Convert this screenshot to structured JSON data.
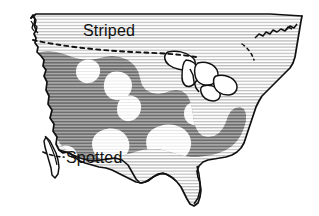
{
  "figure": {
    "type": "thematic-range-map",
    "background_color": "#ffffff",
    "width": 319,
    "height": 216
  },
  "labels": {
    "striped": "Striped",
    "spotted": "Spotted"
  },
  "legend_regions": [
    {
      "key": "striped",
      "label": "Striped",
      "fill_description": "light horizontal line hatching",
      "hatch_color": "#b9b9b9",
      "base_color": "#ffffff",
      "extent": "northern United States, north of dashed boundary"
    },
    {
      "key": "spotted",
      "label": "Spotted",
      "fill_description": "dark horizontal line hatching with white spots",
      "hatch_color": "#7a7a7a",
      "base_color": "#9a9a9a",
      "spot_color": "#ffffff",
      "extent": "western, central and southeastern United States"
    }
  ],
  "colors": {
    "outline": "#111111",
    "light_hatch": "#b9b9b9",
    "dark_hatch": "#6f6f6f",
    "dark_fill": "#9d9d9d",
    "spot": "#ffffff",
    "dashed_boundary": "#111111",
    "background": "#ffffff"
  },
  "boundaries": [
    {
      "key": "striped-range-boundary",
      "style": "dashed",
      "description": "dashed line marking southern limit of Striped range across northern states"
    },
    {
      "key": "spotted-leader-line",
      "style": "dashed",
      "description": "short dashed leader from Spotted label toward southwest coast"
    },
    {
      "key": "northeast-dashed-segment",
      "style": "dashed",
      "description": "dashed segment continuing into the Northeast"
    }
  ],
  "map_features": [
    {
      "key": "canada-border",
      "name": "northern straight border"
    },
    {
      "key": "great-lakes",
      "name": "Great Lakes"
    },
    {
      "key": "florida-peninsula",
      "name": "Florida peninsula"
    },
    {
      "key": "baja-peninsula",
      "name": "Baja California peninsula"
    },
    {
      "key": "gulf-of-california",
      "name": "Gulf of California"
    },
    {
      "key": "puget-sound",
      "name": "Puget Sound"
    },
    {
      "key": "new-england-coast",
      "name": "New England coast"
    }
  ]
}
